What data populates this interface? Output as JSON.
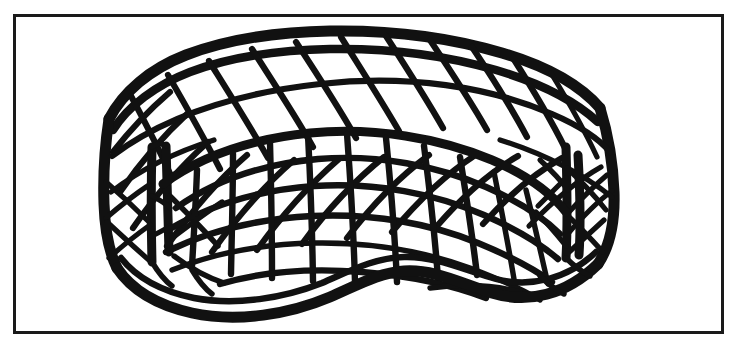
{
  "figure": {
    "description": "Black ink line drawing of a woven rattan tub chair with diamond lattice back, gridded seat cushion and wavy kidney-shaped base, inside a thin rectangular frame",
    "medium": "pen-and-ink line drawing",
    "ink_color": "#111111",
    "background_color": "#ffffff",
    "frame_color": "#1a1a1a"
  },
  "canvas": {
    "width": 737,
    "height": 347
  },
  "frame": {
    "name": "border-frame",
    "x": 14,
    "y": 15,
    "width": 709,
    "height": 318,
    "stroke_width": 3
  },
  "subject": {
    "object_name": "woven-chair",
    "parts": [
      "backrest-lattice",
      "left-arm-post",
      "right-arm-post",
      "seat-cushion-mesh",
      "base-rim"
    ]
  },
  "parts": {
    "backrest": {
      "label": "diamond-lattice-backrest",
      "pattern": "diamond",
      "cell_count_across": 12,
      "cell_rows": 3
    },
    "cushion": {
      "label": "seat-cushion-mesh",
      "pattern": "curved-quadrilateral-grid",
      "vertical_ribs": 11,
      "horizontal_courses": 5
    },
    "base": {
      "label": "wavy-base-rim",
      "shape": "kidney-wave"
    },
    "arms": {
      "left_label": "left-arm-post",
      "right_label": "right-arm-post"
    }
  }
}
